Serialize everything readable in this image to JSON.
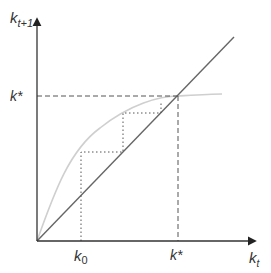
{
  "diagram": {
    "y_axis_label": {
      "base": "k",
      "sub": "t+1"
    },
    "x_axis_label": {
      "base": "k",
      "sub": "t"
    },
    "steady_state_y_label": "k*",
    "steady_state_x_label": "k*",
    "initial_label": {
      "base": "k",
      "sub": "0"
    },
    "colors": {
      "axis": "#333333",
      "diagonal": "#555555",
      "curve": "#cfcfcf",
      "dashed": "#555555",
      "dotted": "#555555"
    },
    "elements": [
      "45-degree line",
      "concave transition curve k(t+1) = f(k(t))",
      "dashed guides at steady state k*",
      "dotted cobweb staircase from k0 to k*"
    ]
  }
}
